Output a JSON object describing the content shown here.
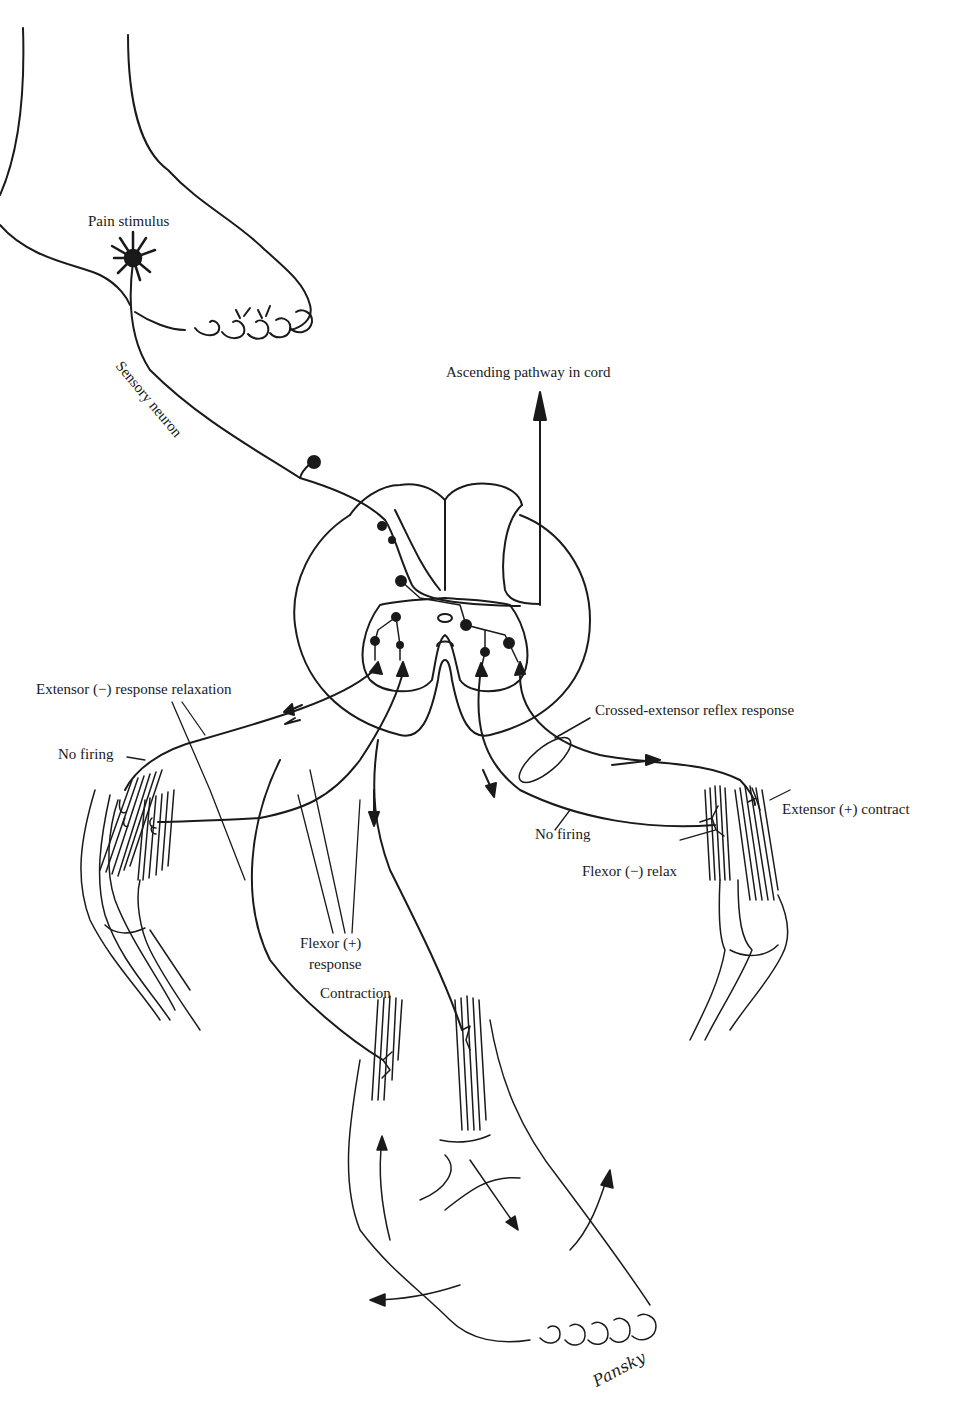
{
  "figure": {
    "subject": "Crossed-extensor reflex",
    "line_color": "#1a1a1a",
    "background": "#ffffff"
  },
  "labels": {
    "pain_stimulus": "Pain stimulus",
    "sensory_neuron": "Sensory neuron",
    "ascending_pathway": "Ascending pathway in cord",
    "extensor_relaxation": "Extensor (−) response relaxation",
    "no_firing_left": "No firing",
    "crossed_extensor": "Crossed-extensor reflex response",
    "no_firing_right": "No firing",
    "extensor_contract": "Extensor (+) contract",
    "flexor_relax": "Flexor (−) relax",
    "flexor_response_line1": "Flexor (+)",
    "flexor_response_line2": "response",
    "contraction": "Contraction",
    "signature": "Pansky"
  }
}
